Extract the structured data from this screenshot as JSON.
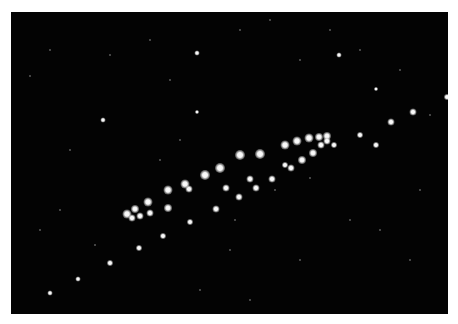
{
  "image": {
    "description": "Diagonal band of bright star-like dots on a black field, white margin",
    "background": "#030303",
    "border_color": "#ffffff",
    "bright_dots": [
      [
        127,
        214,
        9
      ],
      [
        135,
        209,
        8
      ],
      [
        132,
        218,
        7
      ],
      [
        140,
        216,
        7
      ],
      [
        148,
        202,
        9
      ],
      [
        150,
        213,
        7
      ],
      [
        168,
        190,
        9
      ],
      [
        168,
        208,
        8
      ],
      [
        189,
        189,
        7
      ],
      [
        185,
        184,
        9
      ],
      [
        190,
        222,
        6
      ],
      [
        205,
        175,
        10
      ],
      [
        220,
        168,
        10
      ],
      [
        163,
        236,
        6
      ],
      [
        139,
        248,
        6
      ],
      [
        110,
        263,
        6
      ],
      [
        78,
        279,
        5
      ],
      [
        50,
        293,
        5
      ],
      [
        216,
        209,
        7
      ],
      [
        226,
        188,
        7
      ],
      [
        239,
        197,
        7
      ],
      [
        240,
        155,
        10
      ],
      [
        250,
        179,
        7
      ],
      [
        256,
        188,
        7
      ],
      [
        260,
        154,
        10
      ],
      [
        272,
        179,
        7
      ],
      [
        285,
        145,
        9
      ],
      [
        285,
        165,
        6
      ],
      [
        291,
        168,
        7
      ],
      [
        297,
        141,
        9
      ],
      [
        302,
        160,
        8
      ],
      [
        309,
        138,
        9
      ],
      [
        313,
        153,
        8
      ],
      [
        319,
        137,
        8
      ],
      [
        321,
        145,
        7
      ],
      [
        327,
        136,
        8
      ],
      [
        327,
        141,
        7
      ],
      [
        334,
        145,
        6
      ],
      [
        360,
        135,
        6
      ],
      [
        376,
        145,
        6
      ],
      [
        391,
        122,
        7
      ],
      [
        413,
        112,
        7
      ],
      [
        447,
        97,
        6
      ],
      [
        197,
        53,
        5
      ],
      [
        103,
        120,
        5
      ],
      [
        339,
        55,
        5
      ],
      [
        197,
        112,
        4
      ],
      [
        376,
        89,
        4
      ]
    ],
    "faint_dots": [
      [
        30,
        76
      ],
      [
        50,
        50
      ],
      [
        110,
        55
      ],
      [
        150,
        40
      ],
      [
        170,
        80
      ],
      [
        240,
        30
      ],
      [
        270,
        20
      ],
      [
        300,
        60
      ],
      [
        330,
        30
      ],
      [
        360,
        50
      ],
      [
        400,
        70
      ],
      [
        430,
        115
      ],
      [
        420,
        190
      ],
      [
        380,
        230
      ],
      [
        310,
        178
      ],
      [
        275,
        190
      ],
      [
        235,
        220
      ],
      [
        60,
        210
      ],
      [
        95,
        245
      ],
      [
        130,
        320
      ],
      [
        200,
        290
      ],
      [
        250,
        300
      ],
      [
        300,
        260
      ],
      [
        350,
        220
      ],
      [
        410,
        260
      ],
      [
        70,
        150
      ],
      [
        40,
        230
      ],
      [
        160,
        160
      ],
      [
        180,
        140
      ],
      [
        230,
        250
      ]
    ]
  }
}
